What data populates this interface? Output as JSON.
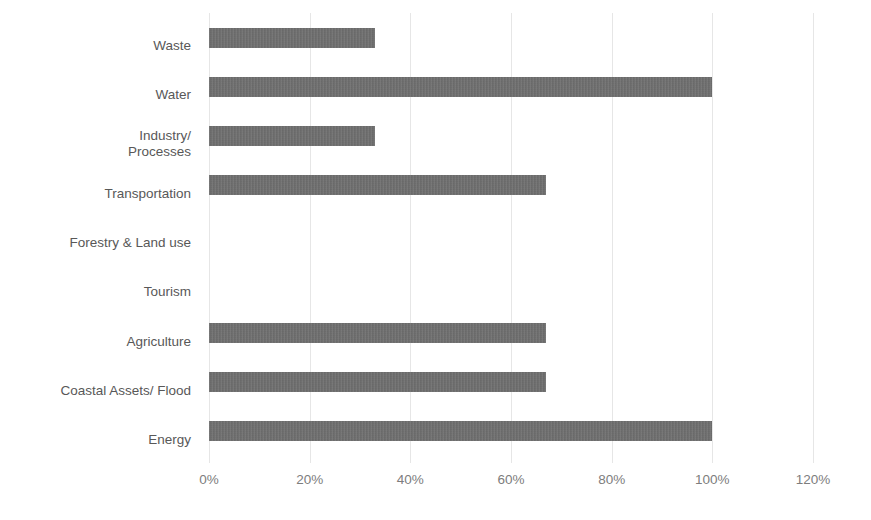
{
  "chart_data": {
    "type": "bar",
    "orientation": "horizontal",
    "title": "",
    "subtitle": "",
    "xlabel": "",
    "ylabel": "",
    "categories": [
      "Waste",
      "Water",
      "Industry/\nProcesses",
      "Transportation",
      "Forestry & Land use",
      "Tourism",
      "Agriculture",
      "Coastal Assets/ Flood",
      "Energy"
    ],
    "values": [
      33,
      100,
      33,
      67,
      0,
      0,
      67,
      67,
      100
    ],
    "value_labels": [
      "33%",
      "100%",
      "33%",
      "67%",
      "0%",
      "0%",
      "67%",
      "67%",
      "100%"
    ],
    "xlim": [
      0,
      120
    ],
    "x_tick_values": [
      0,
      20,
      40,
      60,
      80,
      100,
      120
    ],
    "x_tick_labels": [
      "0%",
      "20%",
      "40%",
      "60%",
      "80%",
      "100%",
      "120%"
    ],
    "grid": "vertical",
    "legend": "none",
    "bar_color": "#6e6e6e",
    "gridline_color": "#e6e6e6",
    "category_label_color": "#585858",
    "tick_label_color": "#7d7d7d",
    "background_color": "#ffffff"
  }
}
